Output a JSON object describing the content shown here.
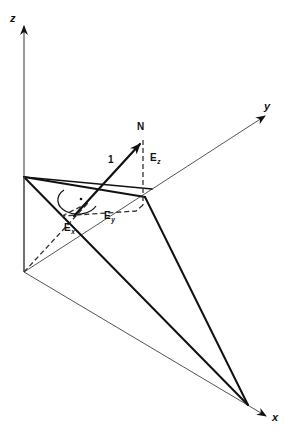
{
  "figure": {
    "background_color": "#ffffff",
    "line_color": "#111111",
    "axis_color": "#555555",
    "dashed_color": "#333333"
  },
  "axes": {
    "z": {
      "label": "z",
      "icon": "arrow-up-icon"
    },
    "y": {
      "label": "y",
      "icon": "arrow-upright-icon"
    },
    "x": {
      "label": "x",
      "icon": "arrow-downright-icon"
    }
  },
  "vector": {
    "tip_label": "N",
    "magnitude_label": "1"
  },
  "components": {
    "z": {
      "base": "E",
      "sub": "z"
    },
    "y": {
      "base": "E",
      "sub": "y"
    },
    "x": {
      "base": "E",
      "sub": "x"
    }
  },
  "markers": {
    "right_angle": "right-angle-marker"
  },
  "caption": {
    "text": ""
  }
}
